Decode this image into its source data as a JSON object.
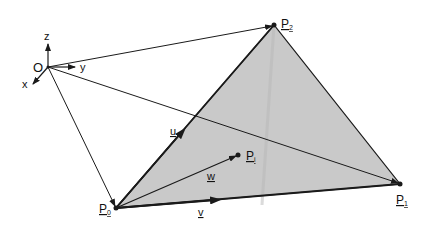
{
  "diagram": {
    "colors": {
      "triangle_fill": "#c9c9c9",
      "stroke": "#1a1a1a",
      "background": "#ffffff"
    },
    "origin": {
      "label": "O",
      "x": 48,
      "y": 67
    },
    "axes": [
      {
        "label": "z",
        "x2": 48,
        "y2": 43
      },
      {
        "label": "y",
        "x2": 76,
        "y2": 67
      },
      {
        "label": "x",
        "x2": 32,
        "y2": 85
      }
    ],
    "points": {
      "P0": {
        "label": "P",
        "subscript": "0",
        "x": 116,
        "y": 208
      },
      "P1": {
        "label": "P",
        "subscript": "1",
        "x": 400,
        "y": 184
      },
      "P2": {
        "label": "P",
        "subscript": "2",
        "x": 274,
        "y": 25
      },
      "Pi": {
        "label": "P",
        "subscript": "i",
        "x": 238,
        "y": 155
      }
    },
    "vectors": {
      "u": {
        "label": "u"
      },
      "v": {
        "label": "v"
      },
      "w": {
        "label": "w"
      }
    }
  }
}
